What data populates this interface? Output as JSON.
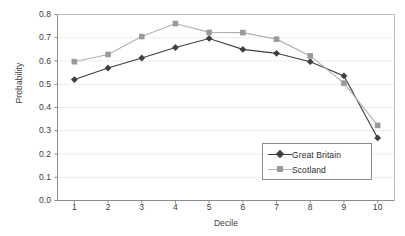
{
  "chart_data": {
    "type": "line",
    "title": "",
    "xlabel": "Decile",
    "ylabel": "Probability",
    "categories": [
      "1",
      "2",
      "3",
      "4",
      "5",
      "6",
      "7",
      "8",
      "9",
      "10"
    ],
    "x": [
      1,
      2,
      3,
      4,
      5,
      6,
      7,
      8,
      9,
      10
    ],
    "xlim": [
      0.5,
      10.5
    ],
    "ylim": [
      0.0,
      0.8
    ],
    "yticks": [
      "0.0",
      "0.1",
      "0.2",
      "0.3",
      "0.4",
      "0.5",
      "0.6",
      "0.7",
      "0.8"
    ],
    "ytick_values": [
      0.0,
      0.1,
      0.2,
      0.3,
      0.4,
      0.5,
      0.6,
      0.7,
      0.8
    ],
    "grid": "horizontal",
    "legend_position": "inside-lower-right",
    "series": [
      {
        "name": "Great Britain",
        "marker": "diamond",
        "color": "#3f3f3f",
        "values": [
          0.52,
          0.57,
          0.613,
          0.658,
          0.697,
          0.65,
          0.633,
          0.597,
          0.536,
          0.269
        ]
      },
      {
        "name": "Scotland",
        "marker": "square",
        "color": "#9a9a9a",
        "values": [
          0.597,
          0.628,
          0.705,
          0.761,
          0.723,
          0.722,
          0.694,
          0.622,
          0.505,
          0.323
        ]
      }
    ]
  },
  "axis": {
    "line_color": "#8c8c8c",
    "grid_color": "#ececec",
    "text_color": "#3a3a3a"
  }
}
